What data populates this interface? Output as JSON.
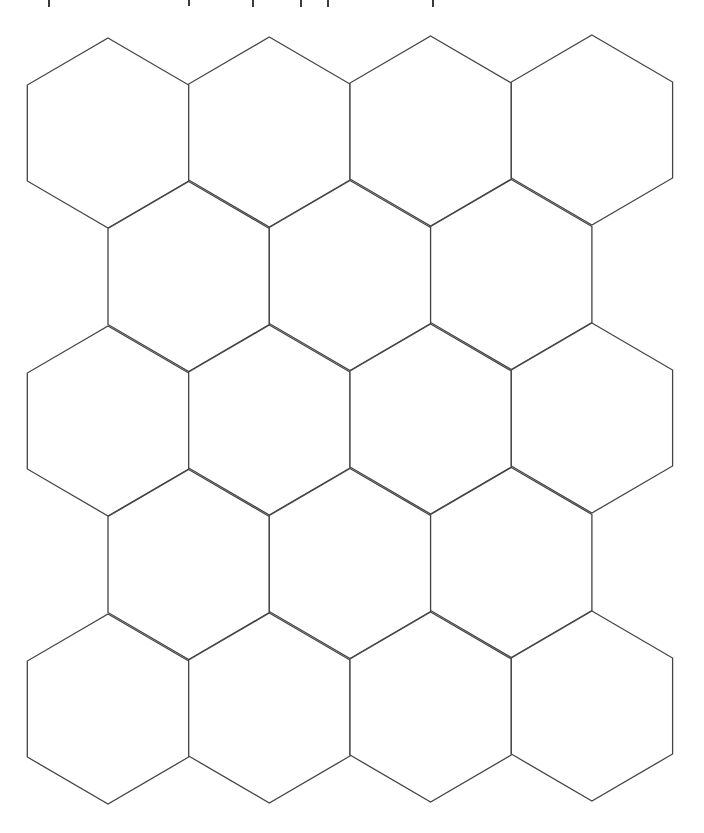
{
  "page": {
    "width": 704,
    "height": 833,
    "background": "#ffffff",
    "line_color": "#444444"
  },
  "cutoff_text_descenders": [
    {
      "glyph": "p",
      "x": 48,
      "height": 7
    },
    {
      "glyph": "g",
      "x": 188,
      "height": 6
    },
    {
      "glyph": "y",
      "x": 252,
      "height": 7
    },
    {
      "glyph": "p",
      "x": 300,
      "height": 7
    },
    {
      "glyph": "p",
      "x": 327,
      "height": 7
    },
    {
      "glyph": "p",
      "x": 432,
      "height": 7
    }
  ],
  "hex_grid": {
    "shape": "pointy-top hexagon",
    "rows": 5,
    "row_counts": [
      4,
      3,
      4,
      3,
      4
    ],
    "hex_width": 161.3,
    "shoulder_drop": 47,
    "side_height": 96,
    "row_pitch": 144,
    "origin_center_x": 108,
    "origin_top_y": 38,
    "column_tilt_y": -1,
    "odd_row_offset_x": 80.65,
    "total_hexagons": 18
  }
}
